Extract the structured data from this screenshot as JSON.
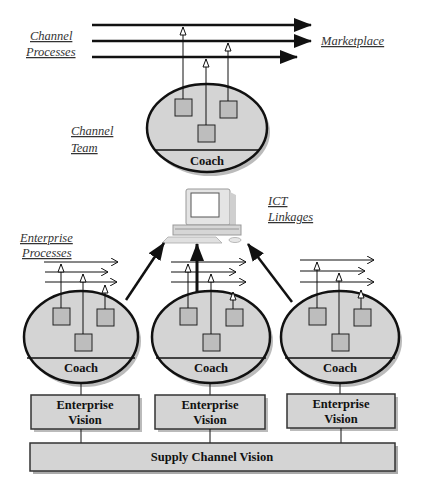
{
  "labels": {
    "channel_processes_line1": "Channel",
    "channel_processes_line2": "Processes",
    "marketplace": "Marketplace",
    "channel_team_line1": "Channel",
    "channel_team_line2": "Team",
    "ict_line1": "ICT",
    "ict_line2": "Linkages",
    "enterprise_processes_line1": "Enterprise",
    "enterprise_processes_line2": "Processes"
  },
  "channel_team": {
    "coach": "Coach"
  },
  "enterprises": [
    {
      "coach": "Coach",
      "vision_line1": "Enterprise",
      "vision_line2": "Vision"
    },
    {
      "coach": "Coach",
      "vision_line1": "Enterprise",
      "vision_line2": "Vision"
    },
    {
      "coach": "Coach",
      "vision_line1": "Enterprise",
      "vision_line2": "Vision"
    }
  ],
  "supply_channel_vision": "Supply Channel Vision",
  "colors": {
    "fill": "#d4d4d4",
    "stroke": "#111111",
    "shadow": "#bbbbbb"
  }
}
